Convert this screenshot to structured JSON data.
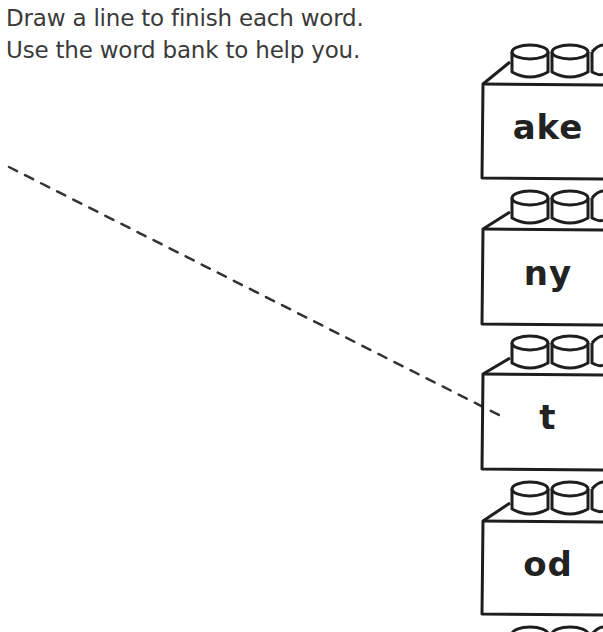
{
  "instructions": {
    "line1": "Draw a line to finish each word.",
    "line2": "Use the word bank to help you."
  },
  "word_bank": {
    "bricks": [
      {
        "label": "ake"
      },
      {
        "label": "ny"
      },
      {
        "label": "t"
      },
      {
        "label": "od"
      }
    ]
  },
  "drawn_line": {
    "style": "dashed",
    "from": [
      9,
      167
    ],
    "to": [
      505,
      418
    ],
    "color": "#333333"
  },
  "colors": {
    "ink": "#222222",
    "text": "#3a3a3a",
    "background": "#ffffff"
  }
}
